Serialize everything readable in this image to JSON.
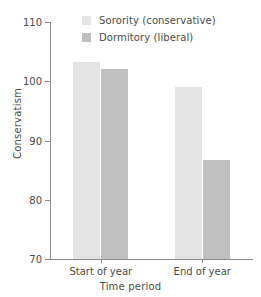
{
  "chart_data": {
    "type": "bar",
    "title": "",
    "subtitle": "",
    "xlabel": "Time period",
    "ylabel": "Conservatism",
    "categories": [
      "Start of year",
      "End of year"
    ],
    "series": [
      {
        "name": "Sorority (conservative)",
        "values": [
          103.3,
          99.0
        ],
        "color": "#e4e4e4"
      },
      {
        "name": "Dormitory (liberal)",
        "values": [
          102.0,
          86.7
        ],
        "color": "#c0c0c0"
      }
    ],
    "ylim": [
      70,
      110
    ],
    "yticks": [
      70,
      80,
      90,
      100,
      110
    ],
    "ytick_labels": [
      "70",
      "80",
      "90",
      "100",
      "110"
    ],
    "grid": false,
    "legend_position": "top-center-inside",
    "legend_entries": [
      "Sorority (conservative)",
      "Dormitory (liberal)"
    ],
    "annotations": []
  },
  "axis": {
    "y_title": "Conservatism",
    "x_title": "Time period"
  }
}
